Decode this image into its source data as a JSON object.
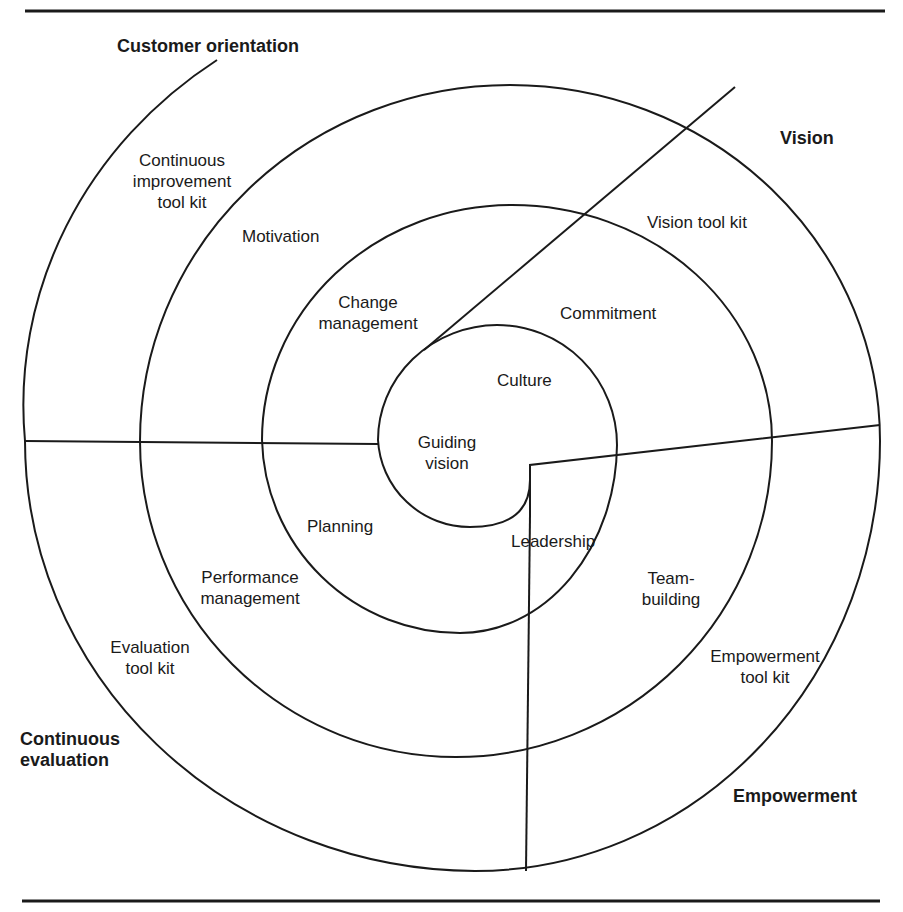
{
  "colors": {
    "ink": "#1a1a1a",
    "background": "#ffffff"
  },
  "sections": {
    "customer_orientation": "Customer orientation",
    "vision": "Vision",
    "empowerment": "Empowerment",
    "continuous_evaluation": [
      "Continuous",
      "evaluation"
    ]
  },
  "toolkits": {
    "continuous_improvement": [
      "Continuous",
      "improvement",
      "tool kit"
    ],
    "vision": "Vision tool kit",
    "empowerment": [
      "Empowerment",
      "tool kit"
    ],
    "evaluation": [
      "Evaluation",
      "tool kit"
    ]
  },
  "middle_ring": {
    "motivation": "Motivation",
    "commitment": "Commitment",
    "team_building": [
      "Team-",
      "building"
    ],
    "performance_management": [
      "Performance",
      "management"
    ]
  },
  "inner_ring": {
    "change_management": [
      "Change",
      "management"
    ],
    "culture": "Culture",
    "leadership": "Leadership",
    "planning": "Planning"
  },
  "center": [
    "Guiding",
    "vision"
  ]
}
